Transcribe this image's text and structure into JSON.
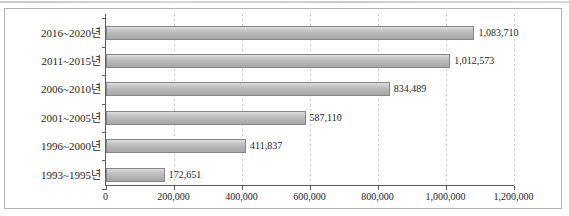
{
  "chart_data": {
    "type": "bar",
    "orientation": "horizontal",
    "title": "",
    "xlabel": "",
    "ylabel": "",
    "categories": [
      "2016~2020년",
      "2011~2015년",
      "2006~2010년",
      "2001~2005년",
      "1996~2000년",
      "1993~1995년"
    ],
    "values": [
      1083710,
      1012573,
      834489,
      587110,
      411837,
      172651
    ],
    "value_labels": [
      "1,083,710",
      "1,012,573",
      "834,489",
      "587,110",
      "411,837",
      "172,651"
    ],
    "x_tick_values": [
      0,
      200000,
      400000,
      600000,
      800000,
      1000000,
      1200000
    ],
    "x_tick_labels": [
      "0",
      "200,000",
      "400,000",
      "600,000",
      "800,000",
      "1,000,000",
      "1,200,000"
    ],
    "xlim": [
      0,
      1200000
    ],
    "grid": "vertical-dashed",
    "legend": "none",
    "data_labels": "outside-end",
    "colors": {
      "bar_fill": "#b7b7b7",
      "bar_border": "#878787",
      "gridline": "#cbcbcb",
      "axis": "#5e5e5e",
      "frame_border": "#b3b3b3",
      "text": "#1f1f1f",
      "background": "#ffffff"
    }
  }
}
